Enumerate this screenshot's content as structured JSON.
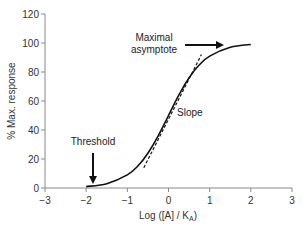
{
  "chart_data": {
    "type": "line",
    "title": "",
    "xlabel": "Log ([A] / K_A)",
    "xlabel_main": "Log ([A] / K",
    "xlabel_sub": "A",
    "xlabel_end": ")",
    "ylabel": "% Max. response",
    "xlim": [
      -3,
      3
    ],
    "ylim": [
      0,
      120
    ],
    "xticks": [
      -3,
      -2,
      -1,
      0,
      1,
      2,
      3
    ],
    "xtick_labels": [
      "−3",
      "−2",
      "−1",
      "0",
      "1",
      "2",
      "3"
    ],
    "yticks": [
      0,
      20,
      40,
      60,
      80,
      100,
      120
    ],
    "ytick_labels": [
      "0",
      "20",
      "40",
      "60",
      "80",
      "100",
      "120"
    ],
    "grid": false,
    "legend": null,
    "series": [
      {
        "name": "Concentration-response curve",
        "style": "solid",
        "x": [
          -2.0,
          -1.5,
          -1.0,
          -0.75,
          -0.5,
          -0.25,
          0.0,
          0.25,
          0.5,
          0.75,
          1.0,
          1.5,
          2.0
        ],
        "y": [
          1,
          3,
          9,
          15,
          24,
          36,
          50,
          64,
          76,
          85,
          91,
          97,
          99
        ]
      },
      {
        "name": "Slope tangent",
        "style": "dashed",
        "x": [
          -0.6,
          0.8
        ],
        "y": [
          14,
          92
        ]
      }
    ],
    "annotations": [
      {
        "text": "Maximal",
        "line2": "asymptote",
        "x": -0.7,
        "y": 100,
        "arrow": "right"
      },
      {
        "text": "Slope",
        "x": 0.3,
        "y": 52,
        "arrow": null
      },
      {
        "text": "Threshold",
        "x": -2.2,
        "y": 33,
        "arrow": "down",
        "arrow_target_x": -1.85,
        "arrow_target_y": 3
      }
    ]
  }
}
